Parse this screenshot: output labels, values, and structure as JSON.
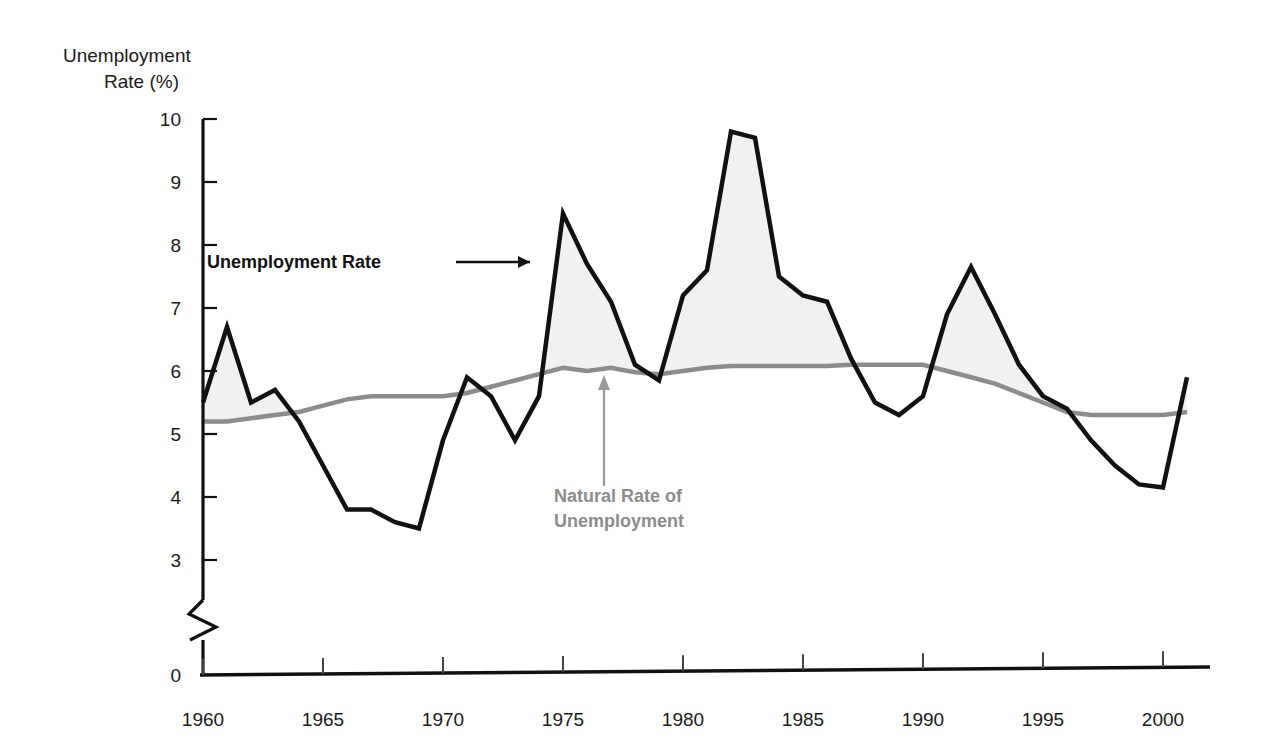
{
  "chart_data": {
    "type": "line",
    "title": "",
    "xlabel": "",
    "ylabel": "Unemployment Rate (%)",
    "ylabel_line1": "Unemployment",
    "ylabel_line2": "Rate (%)",
    "xlim": [
      1960,
      2001
    ],
    "ylim": [
      0,
      10
    ],
    "y_axis_break": true,
    "y_axis_break_note": "axis broken between 0 and 3",
    "grid": false,
    "legend_position": "inline-annotations",
    "yticks": [
      "0",
      "3",
      "4",
      "5",
      "6",
      "7",
      "8",
      "9",
      "10"
    ],
    "ytick_values": [
      0,
      3,
      4,
      5,
      6,
      7,
      8,
      9,
      10
    ],
    "xticks": [
      "1960",
      "1965",
      "1970",
      "1975",
      "1980",
      "1985",
      "1990",
      "1995",
      "2000"
    ],
    "xtick_values": [
      1960,
      1965,
      1970,
      1975,
      1980,
      1985,
      1990,
      1995,
      2000
    ],
    "x": [
      1960,
      1961,
      1962,
      1963,
      1964,
      1965,
      1966,
      1967,
      1968,
      1969,
      1970,
      1971,
      1972,
      1973,
      1974,
      1975,
      1976,
      1977,
      1978,
      1979,
      1980,
      1981,
      1982,
      1983,
      1984,
      1985,
      1986,
      1987,
      1988,
      1989,
      1990,
      1991,
      1992,
      1993,
      1994,
      1995,
      1996,
      1997,
      1998,
      1999,
      2000,
      2001
    ],
    "series": [
      {
        "name": "Unemployment Rate",
        "color": "#111111",
        "linewidth": 4.5,
        "values": [
          5.5,
          6.7,
          5.5,
          5.7,
          5.2,
          4.5,
          3.8,
          3.8,
          3.6,
          3.5,
          4.9,
          5.9,
          5.6,
          4.9,
          5.6,
          8.5,
          7.7,
          7.1,
          6.1,
          5.85,
          7.2,
          7.6,
          9.8,
          9.7,
          7.5,
          7.2,
          7.1,
          6.2,
          5.5,
          5.3,
          5.6,
          6.9,
          7.65,
          6.9,
          6.1,
          5.6,
          5.4,
          4.9,
          4.5,
          4.2,
          4.15,
          5.9
        ]
      },
      {
        "name": "Natural Rate of Unemployment",
        "color": "#8c8c8c",
        "linewidth": 4.5,
        "values": [
          5.2,
          5.2,
          5.25,
          5.3,
          5.35,
          5.45,
          5.55,
          5.6,
          5.6,
          5.6,
          5.6,
          5.65,
          5.75,
          5.85,
          5.95,
          6.05,
          6.0,
          6.05,
          5.98,
          5.95,
          6.0,
          6.05,
          6.08,
          6.08,
          6.08,
          6.08,
          6.08,
          6.1,
          6.1,
          6.1,
          6.1,
          6.0,
          5.9,
          5.8,
          5.65,
          5.5,
          5.35,
          5.3,
          5.3,
          5.3,
          5.3,
          5.35
        ]
      }
    ],
    "fill_between_note": "light gray shading where unemployment rate exceeds natural rate",
    "fill_color": "#f1f1f1",
    "annotations": [
      {
        "text": "Unemployment Rate",
        "color": "#111111",
        "arrow": "right"
      },
      {
        "text_line1": "Natural Rate of",
        "text_line2": "Unemployment",
        "color": "#8c8c8c",
        "arrow": "up"
      }
    ]
  }
}
